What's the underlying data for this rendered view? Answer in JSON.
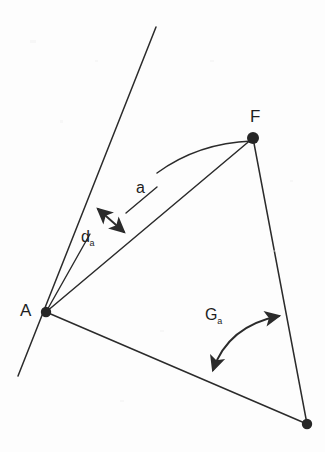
{
  "figure": {
    "type": "geometry-diagram",
    "background_color": "#fdfdfd",
    "stroke_color": "#2b2b2b",
    "label_color": "#1e1e1e",
    "width": 325,
    "height": 452,
    "points": [
      {
        "id": "A",
        "label": "A",
        "x": 46,
        "y": 312,
        "label_x": 21,
        "label_y": 303,
        "radius": 5
      },
      {
        "id": "F",
        "label": "F",
        "x": 253,
        "y": 138,
        "label_x": 249,
        "label_y": 110,
        "radius": 6
      },
      {
        "id": "P",
        "label": "",
        "x": 307,
        "y": 424,
        "label_x": 0,
        "label_y": 0,
        "radius": 5
      }
    ],
    "labels": [
      {
        "id": "label-a",
        "text": "a",
        "sub": "",
        "x": 136,
        "y": 181
      },
      {
        "id": "label-d-a",
        "text": "d",
        "sub": "a",
        "x": 82,
        "y": 230
      },
      {
        "id": "label-G-a",
        "text": "G",
        "sub": "a",
        "x": 206,
        "y": 308
      }
    ],
    "segments": [
      {
        "id": "ray-A-up",
        "from": [
          18,
          376
        ],
        "to": [
          156,
          27
        ],
        "desc": "long straight line through A"
      },
      {
        "id": "seg-A-F",
        "from": [
          46,
          312
        ],
        "to": [
          253,
          138
        ],
        "desc": "segment from A to F"
      },
      {
        "id": "seg-F-P",
        "from": [
          253,
          138
        ],
        "to": [
          307,
          424
        ],
        "desc": "segment from F to lower point"
      },
      {
        "id": "seg-A-P",
        "from": [
          46,
          312
        ],
        "to": [
          307,
          424
        ],
        "desc": "segment from A to lower point"
      },
      {
        "id": "leader-d-a",
        "from": [
          46,
          312
        ],
        "to": [
          90,
          234
        ],
        "desc": "leader line for d subscript a"
      },
      {
        "id": "leader-a",
        "from": [
          156,
          188
        ],
        "to": [
          127,
          212
        ],
        "desc": "leader line for label a"
      }
    ],
    "arcs": [
      {
        "id": "arc-a-from-F",
        "from": [
          253,
          140
        ],
        "to": [
          157,
          173
        ],
        "control": [
          196,
          144
        ],
        "desc": "arc measuring distance a from F"
      },
      {
        "id": "arc-G-a",
        "from": [
          212,
          372
        ],
        "to": [
          281,
          314
        ],
        "control": [
          224,
          322
        ],
        "desc": "double-headed curved arc for angle G subscript a"
      }
    ],
    "arrows": [
      {
        "id": "arrow-d-a",
        "from": [
          96,
          207
        ],
        "to": [
          126,
          234
        ],
        "heads": "both",
        "desc": "double headed arrow for d subscript a"
      },
      {
        "id": "arrow-G-a-lower",
        "at": [
          212,
          372
        ],
        "desc": "arrowhead at lower end of angle arc"
      },
      {
        "id": "arrow-G-a-upper",
        "at": [
          281,
          314
        ],
        "desc": "arrowhead at upper end of angle arc"
      }
    ]
  }
}
